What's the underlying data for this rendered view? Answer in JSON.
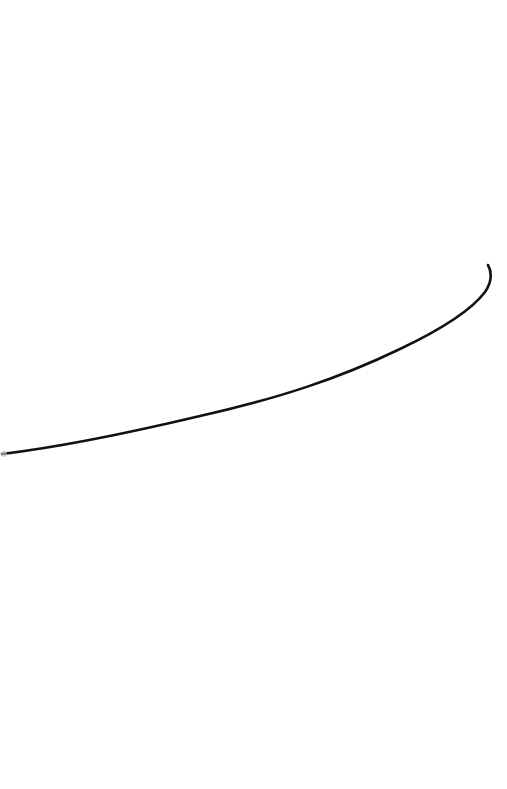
{
  "canvas": {
    "background": "#ffffff",
    "width": 507,
    "height": 789
  },
  "strokes": [
    {
      "color": "#111111",
      "width": 2.6,
      "path": "M 2 454 C 60 447, 120 435, 200 416 C 280 398, 340 378, 400 349 C 440 330, 470 312, 485 292 C 492 282, 492 272, 488 265"
    }
  ],
  "stroke_start_marker": {
    "x": 1,
    "y": 451,
    "color": "#bdbdbd"
  }
}
